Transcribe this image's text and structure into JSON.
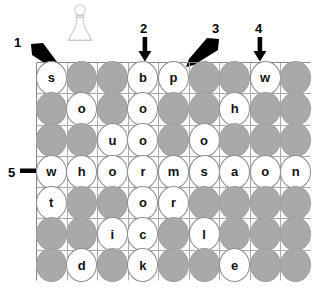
{
  "figure": {
    "type": "word-search-grid-puzzle",
    "pawn_icon": "chess-pawn-icon",
    "rows": 7,
    "cols": 9,
    "colors": {
      "blank_fill": "#a9a9a9",
      "letter_fill": "#ffffff",
      "grid_line": "#aaaaaa",
      "grid_border": "#888888",
      "text": "#111111",
      "pawn_outline": "#cccccc"
    },
    "grid": [
      [
        "s",
        "",
        "",
        "b",
        "p",
        "",
        "",
        "w",
        ""
      ],
      [
        "",
        "o",
        "",
        "o",
        "",
        "",
        "h",
        "",
        ""
      ],
      [
        "",
        "",
        "u",
        "o",
        "",
        "o",
        "",
        "",
        ""
      ],
      [
        "w",
        "h",
        "o",
        "r",
        "m",
        "s",
        "a",
        "o",
        "n"
      ],
      [
        "t",
        "",
        "",
        "o",
        "r",
        "",
        "",
        "",
        ""
      ],
      [
        "",
        "",
        "i",
        "c",
        "",
        "l",
        "",
        "",
        ""
      ],
      [
        "",
        "d",
        "",
        "k",
        "",
        "",
        "e",
        "",
        ""
      ]
    ],
    "callouts": [
      {
        "label": "1",
        "direction": "down-right",
        "num_x": 14,
        "num_y": 36,
        "arrow_x": 30,
        "arrow_y": 44,
        "arrow_w": 32,
        "arrow_h": 30
      },
      {
        "label": "2",
        "direction": "down",
        "num_x": 140,
        "num_y": 22,
        "arrow_x": 138,
        "arrow_y": 36,
        "arrow_w": 14,
        "arrow_h": 26
      },
      {
        "label": "3",
        "direction": "down-left",
        "num_x": 212,
        "num_y": 22,
        "arrow_x": 184,
        "arrow_y": 36,
        "arrow_w": 34,
        "arrow_h": 30
      },
      {
        "label": "4",
        "direction": "down",
        "num_x": 255,
        "num_y": 22,
        "arrow_x": 253,
        "arrow_y": 36,
        "arrow_w": 14,
        "arrow_h": 26
      },
      {
        "label": "5",
        "direction": "right",
        "num_x": 8,
        "num_y": 167,
        "arrow_x": 22,
        "arrow_y": 165,
        "arrow_w": 26,
        "arrow_h": 14
      }
    ]
  }
}
